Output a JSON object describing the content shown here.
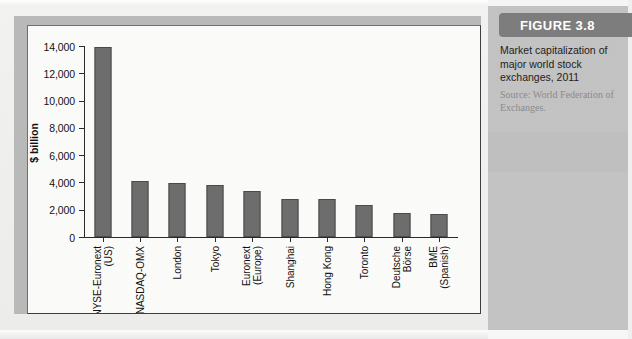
{
  "figure": {
    "banner_label": "FIGURE 3.8",
    "caption": "Market capitalization of major world stock exchanges, 2011",
    "source": "Source: World Federation of Exchanges."
  },
  "chart_data": {
    "type": "bar",
    "title": "Market capitalization of major world stock exchanges, 2011",
    "xlabel": "",
    "ylabel": "$ billion",
    "ylim": [
      0,
      14000
    ],
    "ytick_labels": [
      "14,000",
      "12,000",
      "10,000",
      "8,000",
      "6,000",
      "4,000",
      "2,000",
      "0"
    ],
    "ytick_values": [
      14000,
      12000,
      10000,
      8000,
      6000,
      4000,
      2000,
      0
    ],
    "grid": false,
    "legend": false,
    "bar_color": "#6d6d6d",
    "categories": [
      "NYSE-Euronext (US)",
      "NASDAQ-OMX",
      "London",
      "Tokyo",
      "Euronext (Europe)",
      "Shanghai",
      "Hong Kong",
      "Toronto",
      "Deutsche Börse",
      "BME (Spanish)"
    ],
    "category_lines": [
      [
        "NYSE-Euronext",
        "(US)"
      ],
      [
        "NASDAQ-OMX"
      ],
      [
        "London"
      ],
      [
        "Tokyo"
      ],
      [
        "Euronext",
        "(Europe)"
      ],
      [
        "Shanghai"
      ],
      [
        "Hong Kong"
      ],
      [
        "Toronto"
      ],
      [
        "Deutsche",
        "Börse"
      ],
      [
        "BME",
        "(Spanish)"
      ]
    ],
    "values": [
      13900,
      4100,
      3950,
      3800,
      3350,
      2800,
      2750,
      2350,
      1750,
      1700
    ]
  }
}
